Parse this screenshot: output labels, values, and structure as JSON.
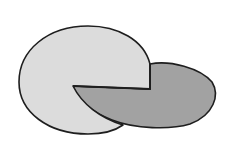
{
  "diagram": {
    "background": "#ffffff",
    "stroke": "#1e1e1e",
    "shapes": [
      {
        "name": "light-cut-ellipse",
        "fill": "#dcdcdc"
      },
      {
        "name": "dark-ellipse",
        "fill": "#a2a2a2"
      }
    ]
  }
}
